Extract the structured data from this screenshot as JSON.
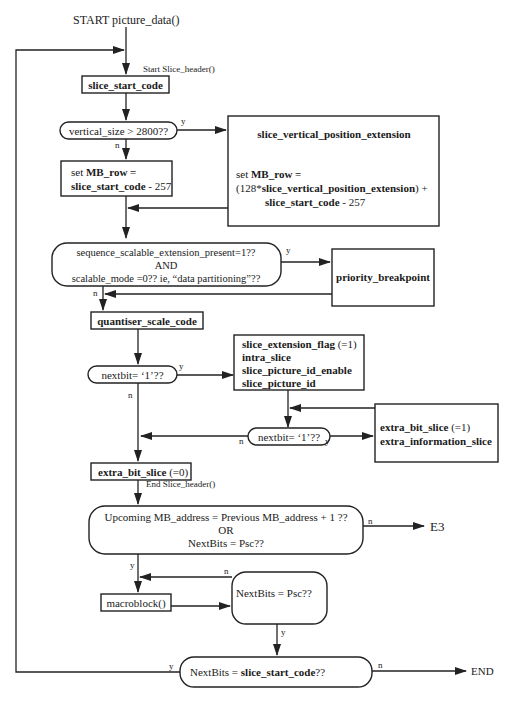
{
  "diagram": {
    "type": "flowchart",
    "start_label": "START  picture_data()",
    "slice_header_start": "Start Slice_header()",
    "slice_header_end": "End Slice_header()",
    "nodes": {
      "slice_start_code": "slice_start_code",
      "vertical_size_check": "vertical_size > 2800??",
      "set_mb_row_1": "set MB_row =",
      "set_mb_row_2": "slice_start_code - 257",
      "svpe_title": "slice_vertical_position_extension",
      "svpe_line1": "set MB_row =",
      "svpe_line2": "(128*slice_vertical_position_extension) +",
      "svpe_line3": "slice_start_code - 257",
      "scalable_line1": "sequence_scalable_extension_present=1??",
      "scalable_line2": "AND",
      "scalable_line3": "scalable_mode =0??  ie,  “data partitioning”??",
      "priority_breakpoint": "priority_breakpoint",
      "quantiser_scale_code": "quantiser_scale_code",
      "nextbit_check_1": "nextbit= ‘1’??",
      "ext_line1": "slice_extension_flag",
      "ext_line1_suffix": " (=1)",
      "ext_line2": "intra_slice",
      "ext_line3": "slice_picture_id_enable",
      "ext_line4": "slice_picture_id",
      "nextbit_check_2": "nextbit= ‘1’??",
      "extra_line1": "extra_bit_slice",
      "extra_line1_suffix": " (=1)",
      "extra_line2": "extra_information_slice",
      "extra_bit_slice_0": "extra_bit_slice",
      "extra_bit_slice_0_suffix": " (=0)",
      "mb_address_line1": "Upcoming MB_address =  Previous MB_address + 1 ??",
      "mb_address_line2": "OR",
      "mb_address_line3": "NextBits = Psc??",
      "macroblock": "macroblock()",
      "nextbits_psc": "NextBits = Psc??",
      "final_check_prefix": "NextBits = ",
      "final_check_bold": "slice_start_code",
      "final_check_suffix": "??"
    },
    "terminals": {
      "e3": "E3",
      "end": "END"
    },
    "branch_labels": {
      "yes": "y",
      "no": "n"
    }
  }
}
